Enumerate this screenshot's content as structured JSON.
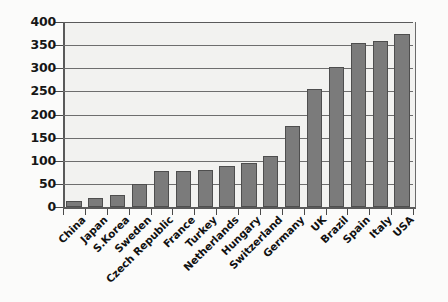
{
  "chart_data": {
    "type": "bar",
    "title": "",
    "subtitle": "",
    "xlabel": "",
    "ylabel": "",
    "ylim": [
      0,
      400
    ],
    "ytick_step": 50,
    "yticks": [
      0,
      50,
      100,
      150,
      200,
      250,
      300,
      350,
      400
    ],
    "grid": true,
    "legend": "none",
    "orientation": "vertical",
    "sorted": "ascending",
    "categories": [
      "China",
      "Japan",
      "S.Korea",
      "Sweden",
      "Czech Republic",
      "France",
      "Turkey",
      "Netherlands",
      "Hungary",
      "Switzerland",
      "Germany",
      "UK",
      "Brazil",
      "Spain",
      "Italy",
      "USA"
    ],
    "values": [
      12,
      20,
      25,
      50,
      78,
      78,
      80,
      88,
      95,
      110,
      175,
      255,
      303,
      355,
      360,
      375
    ],
    "series": [
      {
        "name": "value",
        "values": [
          12,
          20,
          25,
          50,
          78,
          78,
          80,
          88,
          95,
          110,
          175,
          255,
          303,
          355,
          360,
          375
        ]
      }
    ],
    "colors": {
      "bar_fill": "#7b7b7b",
      "bar_stroke": "#4e4e4e",
      "plot_background": "#f2f2f0",
      "gridline": "#6e6e6e",
      "axis": "#5a5a5a",
      "text": "#111111",
      "canvas_background": "#fbfbfa"
    }
  }
}
